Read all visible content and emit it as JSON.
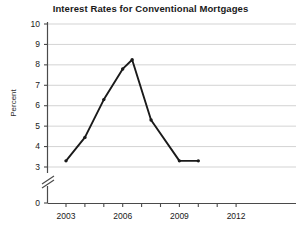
{
  "chart_data": {
    "type": "line",
    "title": "Interest Rates for Conventional Mortgages",
    "xlabel": "",
    "ylabel": "Percent",
    "x": [
      2003,
      2004,
      2005,
      2006,
      2006.5,
      2007.5,
      2009,
      2010
    ],
    "values": [
      3.3,
      4.45,
      6.3,
      7.8,
      8.25,
      5.3,
      3.3,
      3.3
    ],
    "series": [
      {
        "name": "Interest Rate",
        "values": [
          3.3,
          4.45,
          6.3,
          7.8,
          8.25,
          5.3,
          3.3,
          3.3
        ]
      }
    ],
    "xlim": [
      2001.5,
      2012.6
    ],
    "ylim": [
      3,
      10
    ],
    "y_axis_break": true,
    "y_break_between": [
      0,
      3
    ],
    "grid": "horizontal",
    "legend": "none",
    "marker": "dot",
    "line_color": "#1a1a1a",
    "grid_color": "#c8c8c8",
    "axis_color": "#4a4a4a",
    "ytick_labels": [
      "10",
      "9",
      "8",
      "7",
      "6",
      "5",
      "4",
      "3",
      "0"
    ],
    "ytick_values": [
      10,
      9,
      8,
      7,
      6,
      5,
      4,
      3,
      0
    ],
    "xtick_labels": [
      "2003",
      "2006",
      "2009",
      "2012"
    ],
    "xtick_values": [
      2003,
      2006,
      2009,
      2012
    ],
    "xminor_values": [
      2002,
      2003,
      2004,
      2005,
      2006,
      2007,
      2008,
      2009,
      2010,
      2011,
      2012
    ]
  }
}
